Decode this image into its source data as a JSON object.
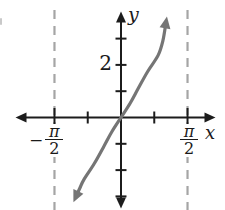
{
  "figure": {
    "colors": {
      "background": "#ffffff",
      "axis": "#1c1c1c",
      "curve": "#757575",
      "asymptote": "#a5a5a5",
      "text": "#1a1a1a"
    },
    "labels": {
      "y_axis": "y",
      "x_axis": "x",
      "y_tick": "2",
      "left_asymptote": {
        "sign": "−",
        "numerator": "π",
        "denominator": "2"
      },
      "right_asymptote": {
        "numerator": "π",
        "denominator": "2"
      }
    }
  },
  "chart_data": {
    "type": "line",
    "series_name": "y = tan x",
    "xlabel": "x",
    "ylabel": "y",
    "grid": false,
    "legend": false,
    "x_ticks_rad": [
      -1.5708,
      -0.7854,
      0.7854,
      1.5708
    ],
    "x_tick_labels": [
      "-π/2",
      "",
      "",
      "π/2"
    ],
    "y_ticks": [
      -3,
      -2,
      -1,
      1,
      2,
      3
    ],
    "y_tick_labels": [
      "",
      "",
      "",
      "",
      "2",
      ""
    ],
    "ylim": [
      -3.6,
      3.6
    ],
    "asymptotes_rad": [
      -1.5708,
      1.5708
    ],
    "points": [
      [
        -1.06,
        -3.0
      ],
      [
        -0.97,
        -2.68
      ],
      [
        -0.875,
        -2.36
      ],
      [
        -0.63,
        -1.75
      ],
      [
        -0.4,
        -1.08
      ],
      [
        -0.22,
        -0.55
      ],
      [
        0,
        0
      ],
      [
        0.22,
        0.55
      ],
      [
        0.4,
        1.08
      ],
      [
        0.63,
        1.75
      ],
      [
        0.875,
        2.36
      ],
      [
        0.99,
        2.92
      ],
      [
        1.06,
        3.6
      ]
    ]
  }
}
